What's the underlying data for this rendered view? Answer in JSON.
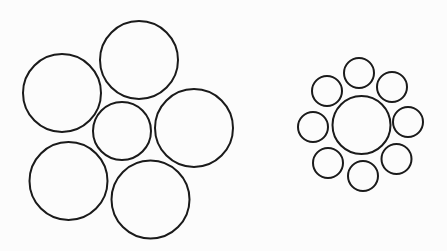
{
  "figure": {
    "width": 447,
    "height": 251,
    "background": "#fcfcfc",
    "stroke_color": "#1a1a1a",
    "stroke_width": 2
  },
  "groups": [
    {
      "name": "left-group-large-surround",
      "center_circle": {
        "cx": 122,
        "cy": 131,
        "r": 29
      },
      "surround_circles": [
        {
          "cx": 139,
          "cy": 60,
          "r": 39
        },
        {
          "cx": 194,
          "cy": 128,
          "r": 39
        },
        {
          "cx": 150.5,
          "cy": 199.5,
          "r": 39
        },
        {
          "cx": 68.5,
          "cy": 181,
          "r": 39
        },
        {
          "cx": 62,
          "cy": 93,
          "r": 39
        }
      ]
    },
    {
      "name": "right-group-small-surround",
      "center_circle": {
        "cx": 361.5,
        "cy": 125,
        "r": 29
      },
      "surround_circles": [
        {
          "cx": 359,
          "cy": 73,
          "r": 15
        },
        {
          "cx": 392,
          "cy": 87,
          "r": 15
        },
        {
          "cx": 408,
          "cy": 122,
          "r": 15
        },
        {
          "cx": 396.5,
          "cy": 159,
          "r": 15
        },
        {
          "cx": 363,
          "cy": 176,
          "r": 15
        },
        {
          "cx": 328,
          "cy": 163,
          "r": 15
        },
        {
          "cx": 313,
          "cy": 127,
          "r": 15
        },
        {
          "cx": 327,
          "cy": 91,
          "r": 15
        }
      ]
    }
  ]
}
